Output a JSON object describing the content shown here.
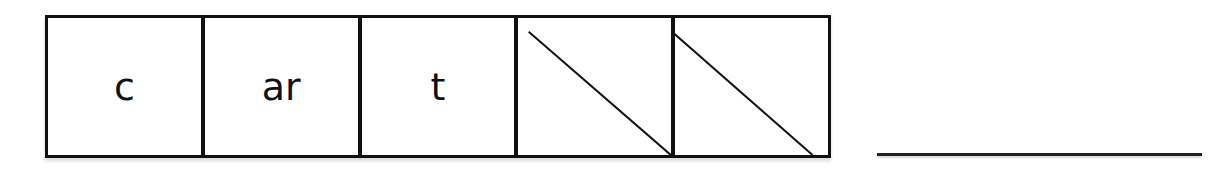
{
  "worksheet": {
    "segments": [
      {
        "text": "c",
        "crossed": false
      },
      {
        "text": "ar",
        "crossed": false
      },
      {
        "text": "t",
        "crossed": false
      },
      {
        "text": "",
        "crossed": true
      },
      {
        "text": "",
        "crossed": true
      }
    ],
    "answer_line": ""
  }
}
